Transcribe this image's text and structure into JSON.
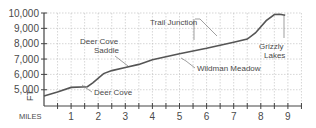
{
  "chart_data": {
    "type": "line",
    "title": "",
    "xlabel": "MILES",
    "ylabel": "FT",
    "xlim": [
      0,
      9.3
    ],
    "ylim": [
      4000,
      10000
    ],
    "grid": true,
    "x_ticks": [
      "1",
      "2",
      "3",
      "4",
      "5",
      "6",
      "7",
      "8",
      "9"
    ],
    "y_ticks": [
      "5,000",
      "6,000",
      "7,000",
      "8,000",
      "9,000",
      "10,000"
    ],
    "series": [
      {
        "name": "Elevation profile",
        "x": [
          0,
          0.5,
          1.0,
          1.6,
          1.8,
          2.2,
          2.5,
          3.0,
          3.5,
          4.0,
          5.0,
          6.0,
          7.0,
          7.5,
          7.8,
          8.2,
          8.5,
          8.7,
          8.9
        ],
        "values": [
          4600,
          4850,
          5150,
          5200,
          5450,
          6050,
          6250,
          6450,
          6650,
          6950,
          7350,
          7700,
          8100,
          8300,
          8700,
          9500,
          9900,
          9920,
          9850
        ]
      }
    ],
    "annotations": [
      {
        "text": [
          "Deer Cove"
        ],
        "x": 1.7,
        "y": 5250
      },
      {
        "text": [
          "Deer Cove",
          "Saddle"
        ],
        "x": 3.0,
        "y": 6450
      },
      {
        "text": [
          "Trail Junction"
        ],
        "x": 5.5,
        "y": 7550
      },
      {
        "text": [
          "Wildman Meadow"
        ],
        "x": 4.8,
        "y": 7300
      },
      {
        "text": [
          "Grizzly",
          "Lakes"
        ],
        "x": 8.9,
        "y": 9850
      }
    ]
  },
  "labels": {
    "x_axis": "MILES",
    "y_axis": "FT",
    "deer_cove": "Deer Cove",
    "deer_cove_saddle_1": "Deer Cove",
    "deer_cove_saddle_2": "Saddle",
    "trail_junction": "Trail Junction",
    "wildman_meadow": "Wildman Meadow",
    "grizzly_1": "Grizzly",
    "grizzly_2": "Lakes"
  },
  "colors": {
    "line": "#555555",
    "axis": "#444444",
    "grid": "#bbbbbb",
    "text": "#4a4a4a"
  }
}
